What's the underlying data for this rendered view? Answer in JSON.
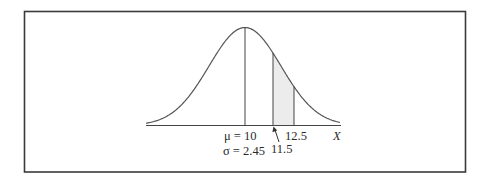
{
  "diagram": {
    "type": "normal-distribution",
    "frame_color": "#3a3a3a",
    "line_color": "#555555",
    "shade_color": "#ececec",
    "labels": {
      "mean": "μ = 10",
      "sd": "σ = 2.45",
      "lower_bound": "11.5",
      "upper_bound": "12.5",
      "axis": "X"
    }
  },
  "chart_data": {
    "type": "area",
    "title": "",
    "xlabel": "X",
    "ylabel": "",
    "distribution": "normal",
    "mean": 10,
    "sd": 2.45,
    "shaded_region": [
      11.5,
      12.5
    ],
    "annotations": [
      {
        "text": "μ = 10",
        "x": 10
      },
      {
        "text": "σ = 2.45",
        "x": 10
      },
      {
        "text": "11.5",
        "x": 11.5,
        "arrow": true
      },
      {
        "text": "12.5",
        "x": 12.5
      }
    ],
    "grid": false,
    "legend": "none"
  }
}
